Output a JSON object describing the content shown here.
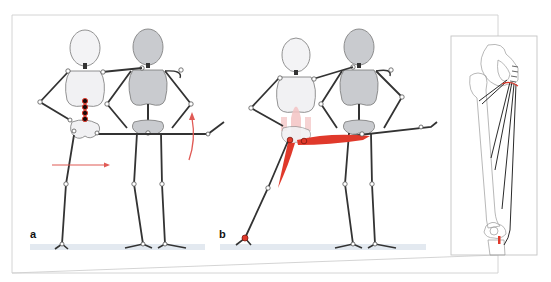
{
  "figure": {
    "panels": [
      {
        "id": "a",
        "label": "a"
      },
      {
        "id": "b",
        "label": "b"
      }
    ],
    "inset": {
      "subject": "femur-with-adductor-muscles"
    }
  },
  "colors": {
    "frame": "#c8c8c8",
    "bone_outline": "#6e6e6e",
    "light_figure_fill": "#f1f1f3",
    "dark_figure_fill": "#c9cbcf",
    "limb_line": "#3a3a3a",
    "joint_fill": "#ffffff",
    "muscle_red": "#e0392b",
    "arrow_red": "#e05a55",
    "pale_pink": "#f3c9c9",
    "ground": "#dfe6ee"
  }
}
